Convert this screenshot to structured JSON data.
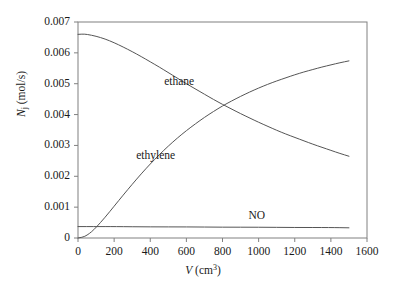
{
  "chart_data": {
    "type": "line",
    "title": "",
    "xlabel": "V (cm3)",
    "xlabel_var": "V",
    "xlabel_unit_base": "(cm",
    "xlabel_unit_exp": "3",
    "xlabel_unit_close": ")",
    "ylabel": "Nj (mol/s)",
    "ylabel_var": "N",
    "ylabel_sub": "j",
    "ylabel_unit": " (mol/s)",
    "xlim": [
      0,
      1600
    ],
    "ylim": [
      0,
      0.007
    ],
    "xticks": [
      0,
      200,
      400,
      600,
      800,
      1000,
      1200,
      1400,
      1600
    ],
    "xtick_labels": [
      "0",
      "200",
      "400",
      "600",
      "800",
      "1000",
      "1200",
      "1400",
      "1600"
    ],
    "yticks": [
      0,
      0.001,
      0.002,
      0.003,
      0.004,
      0.005,
      0.006,
      0.007
    ],
    "ytick_labels": [
      "0",
      "0.001",
      "0.002",
      "0.003",
      "0.004",
      "0.005",
      "0.006",
      "0.007"
    ],
    "grid": false,
    "legend": "inline-annotations",
    "line_color": "#555555",
    "axis_color": "#808080",
    "series": [
      {
        "name": "ethane",
        "label": "ethane",
        "label_x": 560,
        "label_y": 0.00505,
        "x": [
          0,
          25,
          50,
          100,
          150,
          200,
          250,
          300,
          350,
          400,
          450,
          500,
          550,
          600,
          650,
          700,
          750,
          800,
          850,
          900,
          950,
          1000,
          1050,
          1100,
          1150,
          1200,
          1250,
          1300,
          1350,
          1400,
          1450,
          1500
        ],
        "values": [
          0.0066,
          0.00661,
          0.0066,
          0.00654,
          0.00645,
          0.00633,
          0.00619,
          0.00604,
          0.00588,
          0.00571,
          0.00554,
          0.00536,
          0.00518,
          0.005,
          0.00483,
          0.00466,
          0.00449,
          0.00433,
          0.00418,
          0.00403,
          0.00389,
          0.00375,
          0.00362,
          0.00349,
          0.00337,
          0.00326,
          0.00315,
          0.00304,
          0.00294,
          0.00284,
          0.00274,
          0.00265
        ]
      },
      {
        "name": "ethylene",
        "label": "ethylene",
        "label_x": 430,
        "label_y": 0.00265,
        "x": [
          0,
          25,
          50,
          75,
          100,
          150,
          200,
          250,
          300,
          350,
          400,
          450,
          500,
          550,
          600,
          650,
          700,
          750,
          800,
          850,
          900,
          950,
          1000,
          1050,
          1100,
          1150,
          1200,
          1250,
          1300,
          1350,
          1400,
          1450,
          1500
        ],
        "values": [
          0.0,
          2e-05,
          9e-05,
          0.0002,
          0.00034,
          0.00067,
          0.00103,
          0.00139,
          0.00174,
          0.00208,
          0.0024,
          0.0027,
          0.00298,
          0.00324,
          0.00348,
          0.0037,
          0.00391,
          0.0041,
          0.00428,
          0.00444,
          0.00459,
          0.00473,
          0.00486,
          0.00498,
          0.00509,
          0.00519,
          0.00529,
          0.00538,
          0.00546,
          0.00554,
          0.00561,
          0.00568,
          0.00574
        ]
      },
      {
        "name": "NO",
        "label": "NO",
        "label_x": 990,
        "label_y": 0.00072,
        "x": [
          0,
          100,
          200,
          400,
          600,
          800,
          1000,
          1200,
          1400,
          1500
        ],
        "values": [
          0.00037,
          0.00037,
          0.00037,
          0.00036,
          0.00036,
          0.00035,
          0.00035,
          0.00034,
          0.00034,
          0.00033
        ]
      }
    ]
  }
}
